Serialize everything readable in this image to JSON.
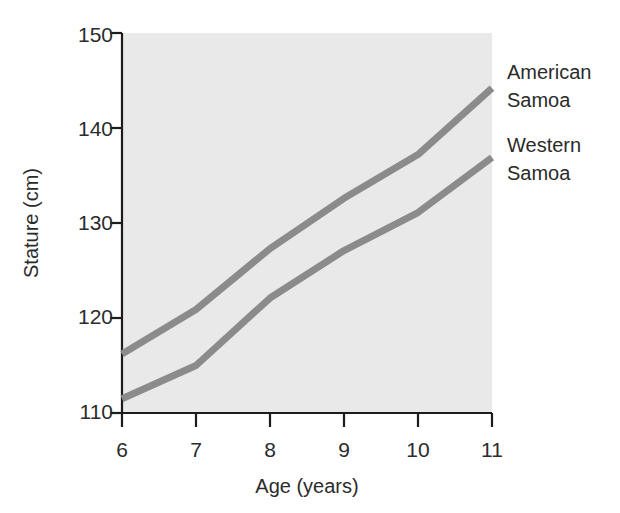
{
  "chart_data": {
    "type": "line",
    "title": "",
    "subtitle": "",
    "xlabel": "Age (years)",
    "ylabel": "Stature (cm)",
    "xlim": [
      6,
      11
    ],
    "ylim": [
      110,
      150
    ],
    "xticks": [
      6,
      7,
      8,
      9,
      10,
      11
    ],
    "xtick_labels": [
      "6",
      "7",
      "8",
      "9",
      "10",
      "11"
    ],
    "yticks": [
      110,
      120,
      130,
      140,
      150
    ],
    "ytick_labels": [
      "110",
      "120",
      "130",
      "140",
      "150"
    ],
    "grid": false,
    "legend_position": "right",
    "plot_background": "#e9e9e9",
    "line_color": "#8b8b8b",
    "axis_color": "#1c1c1c",
    "x": [
      6,
      7,
      8,
      9,
      10,
      11
    ],
    "series": [
      {
        "name": "American Samoa",
        "label_lines": [
          "American",
          "Samoa"
        ],
        "color": "#8b8b8b",
        "values": [
          116.2,
          120.9,
          127.3,
          132.6,
          137.2,
          144.2
        ]
      },
      {
        "name": "Western Samoa",
        "label_lines": [
          "Western",
          "Samoa"
        ],
        "color": "#8b8b8b",
        "values": [
          111.5,
          115.0,
          122.1,
          127.1,
          131.1,
          136.9
        ]
      }
    ],
    "annotations": []
  },
  "legend": {
    "entries": [
      {
        "line1": "American",
        "line2": "Samoa"
      },
      {
        "line1": "Western",
        "line2": "Samoa"
      }
    ]
  },
  "axes": {
    "y_title": "Stature (cm)",
    "x_title": "Age (years)",
    "y_tick_0": "110",
    "y_tick_1": "120",
    "y_tick_2": "130",
    "y_tick_3": "140",
    "y_tick_4": "150",
    "x_tick_0": "6",
    "x_tick_1": "7",
    "x_tick_2": "8",
    "x_tick_3": "9",
    "x_tick_4": "10",
    "x_tick_5": "11"
  }
}
